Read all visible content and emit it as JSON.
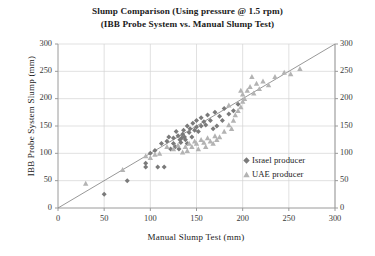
{
  "chart_data": {
    "type": "scatter",
    "title_lines": [
      "Slump Comparison (Using pressure @ 1.5 rpm)",
      "(IBB Probe System vs. Manual Slump Test)"
    ],
    "xlabel": "Manual Slump Test (mm)",
    "ylabel": "IBB Probe System Slump (mm)",
    "xlim": [
      0,
      300
    ],
    "ylim": [
      0,
      300
    ],
    "xticks": [
      0,
      50,
      100,
      150,
      200,
      250,
      300
    ],
    "yticks": [
      0,
      50,
      100,
      150,
      200,
      250,
      300
    ],
    "yticks_right": [
      0,
      50,
      100,
      150,
      200,
      250,
      300
    ],
    "grid": true,
    "legend_position": "inside-right",
    "reference_line": {
      "label": "y = x",
      "from": [
        0,
        0
      ],
      "to": [
        300,
        300
      ],
      "color": "#8c8c8c"
    },
    "series": [
      {
        "name": "Israel producer",
        "marker": "diamond",
        "color": "#7a7a7a",
        "points": [
          [
            50,
            25
          ],
          [
            75,
            50
          ],
          [
            95,
            75
          ],
          [
            95,
            82
          ],
          [
            108,
            75
          ],
          [
            115,
            75
          ],
          [
            100,
            100
          ],
          [
            105,
            105
          ],
          [
            112,
            118
          ],
          [
            118,
            122
          ],
          [
            120,
            130
          ],
          [
            125,
            128
          ],
          [
            125,
            118
          ],
          [
            128,
            140
          ],
          [
            130,
            132
          ],
          [
            132,
            125
          ],
          [
            133,
            120
          ],
          [
            134,
            128
          ],
          [
            135,
            135
          ],
          [
            136,
            142
          ],
          [
            137,
            130
          ],
          [
            138,
            125
          ],
          [
            140,
            118
          ],
          [
            140,
            150
          ],
          [
            142,
            138
          ],
          [
            143,
            145
          ],
          [
            145,
            130
          ],
          [
            146,
            155
          ],
          [
            148,
            142
          ],
          [
            150,
            160
          ],
          [
            150,
            148
          ],
          [
            152,
            140
          ],
          [
            155,
            165
          ],
          [
            155,
            150
          ],
          [
            158,
            158
          ],
          [
            160,
            152
          ],
          [
            162,
            170
          ],
          [
            165,
            160
          ],
          [
            168,
            145
          ],
          [
            170,
            175
          ],
          [
            172,
            150
          ],
          [
            175,
            168
          ],
          [
            178,
            160
          ],
          [
            180,
            182
          ],
          [
            185,
            172
          ],
          [
            190,
            178
          ],
          [
            195,
            190
          ],
          [
            122,
            108
          ],
          [
            127,
            112
          ],
          [
            131,
            108
          ]
        ]
      },
      {
        "name": "UAE producer",
        "marker": "triangle",
        "color": "#b3b3b3",
        "points": [
          [
            30,
            45
          ],
          [
            70,
            70
          ],
          [
            95,
            95
          ],
          [
            100,
            92
          ],
          [
            105,
            98
          ],
          [
            110,
            100
          ],
          [
            118,
            112
          ],
          [
            125,
            108
          ],
          [
            130,
            115
          ],
          [
            135,
            102
          ],
          [
            138,
            112
          ],
          [
            140,
            105
          ],
          [
            142,
            118
          ],
          [
            145,
            112
          ],
          [
            148,
            122
          ],
          [
            150,
            118
          ],
          [
            152,
            108
          ],
          [
            155,
            125
          ],
          [
            158,
            120
          ],
          [
            160,
            112
          ],
          [
            162,
            128
          ],
          [
            165,
            122
          ],
          [
            168,
            118
          ],
          [
            170,
            132
          ],
          [
            172,
            125
          ],
          [
            175,
            130
          ],
          [
            180,
            140
          ],
          [
            185,
            152
          ],
          [
            188,
            145
          ],
          [
            190,
            160
          ],
          [
            192,
            170
          ],
          [
            195,
            178
          ],
          [
            198,
            185
          ],
          [
            200,
            195
          ],
          [
            200,
            208
          ],
          [
            202,
            200
          ],
          [
            205,
            215
          ],
          [
            208,
            222
          ],
          [
            212,
            210
          ],
          [
            215,
            228
          ],
          [
            218,
            218
          ],
          [
            222,
            232
          ],
          [
            228,
            225
          ],
          [
            235,
            240
          ],
          [
            245,
            248
          ],
          [
            252,
            245
          ],
          [
            262,
            255
          ],
          [
            210,
            240
          ],
          [
            198,
            215
          ],
          [
            185,
            188
          ]
        ]
      }
    ]
  }
}
